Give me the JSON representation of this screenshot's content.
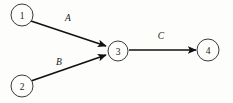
{
  "diagram": {
    "type": "directed-graph",
    "title": "",
    "background_color": "#fdfdfb",
    "node_stroke_color": "#3a3a3a",
    "edge_color": "#111111",
    "text_color": "#1a1a1a",
    "nodes": [
      {
        "id": "1",
        "label": "1",
        "cx": 22,
        "cy": 15,
        "r": 11
      },
      {
        "id": "2",
        "label": "2",
        "cx": 22,
        "cy": 86,
        "r": 11
      },
      {
        "id": "3",
        "label": "3",
        "cx": 118,
        "cy": 51,
        "r": 10
      },
      {
        "id": "4",
        "label": "4",
        "cx": 208,
        "cy": 50,
        "r": 11
      }
    ],
    "edges": [
      {
        "id": "edge-a",
        "label": "A",
        "from": "1",
        "to": "3",
        "x1": 31,
        "y1": 21,
        "x2": 106,
        "y2": 46,
        "label_x": 68,
        "label_y": 18
      },
      {
        "id": "edge-b",
        "label": "B",
        "from": "2",
        "to": "3",
        "x1": 31,
        "y1": 81,
        "x2": 106,
        "y2": 55,
        "label_x": 59,
        "label_y": 62
      },
      {
        "id": "edge-c",
        "label": "C",
        "from": "3",
        "to": "4",
        "x1": 129,
        "y1": 50,
        "x2": 196,
        "y2": 50,
        "label_x": 161,
        "label_y": 36
      }
    ]
  }
}
